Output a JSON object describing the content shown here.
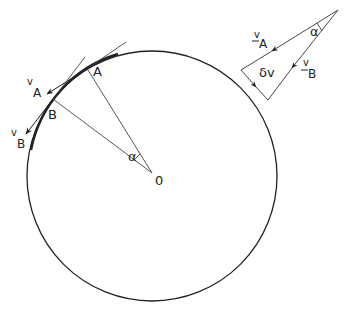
{
  "diagram": {
    "type": "circular-motion-velocity-change",
    "circle": {
      "cx": 152,
      "cy": 176,
      "r": 125,
      "stroke": "#222222"
    },
    "center": {
      "label": "0",
      "x": 152,
      "y": 173
    },
    "points": {
      "A": {
        "label": "A",
        "x": 88,
        "y": 70
      },
      "B": {
        "label": "B",
        "x": 53,
        "y": 99
      }
    },
    "angle_label": "α",
    "velocity_labels": {
      "vA": {
        "v": "v",
        "sub": "A"
      },
      "vB": {
        "v": "v",
        "sub": "B"
      }
    },
    "vector_triangle": {
      "vA": {
        "v": "v",
        "sub": "A"
      },
      "vB": {
        "v": "v",
        "sub": "B"
      },
      "delta_v": "δv",
      "angle": "α"
    }
  }
}
